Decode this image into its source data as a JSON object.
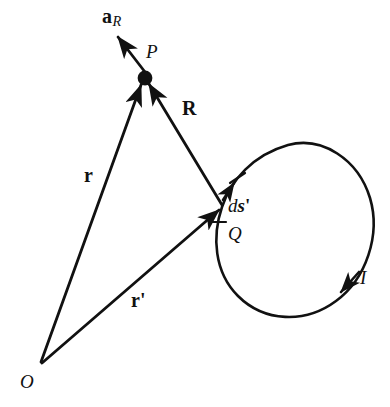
{
  "figure": {
    "type": "physics-vector-diagram",
    "stroke_color": "#111111",
    "background_color": "#ffffff",
    "labels": {
      "unit_vector": {
        "base": "a",
        "subscript": "R",
        "style": "bold-with-italic-subscript"
      },
      "field_point": "P",
      "separation_vector": "R",
      "position_vector_field_point": "r",
      "position_vector_source_point": {
        "base": "r",
        "prime": "'"
      },
      "differential_element": {
        "d": "d",
        "s": "s",
        "prime": "'"
      },
      "source_point": "Q",
      "current": "I",
      "origin": "O"
    }
  },
  "geometry": {
    "origin_point": {
      "x": 40,
      "y": 365
    },
    "field_point_P": {
      "x": 145,
      "y": 78
    },
    "source_point_Q": {
      "x": 222,
      "y": 207
    },
    "loop": {
      "shape": "closed-tilted-oval",
      "top": {
        "x": 305,
        "y": 143
      },
      "right": {
        "x": 372,
        "y": 218
      },
      "bottom": {
        "x": 282,
        "y": 316
      },
      "left": {
        "x": 213,
        "y": 250
      }
    },
    "current_arrow": {
      "x": 345,
      "y": 288,
      "direction": "counterclockwise-indicator"
    },
    "ds_arrow": {
      "x": 234,
      "y": 184,
      "direction": "up-right-tangent"
    },
    "tick_marks": [
      {
        "x": 237,
        "y": 178
      },
      {
        "x": 217,
        "y": 222
      }
    ],
    "aR_arrow": {
      "from": {
        "x": 145,
        "y": 72
      },
      "to": {
        "x": 117,
        "y": 36
      }
    }
  }
}
